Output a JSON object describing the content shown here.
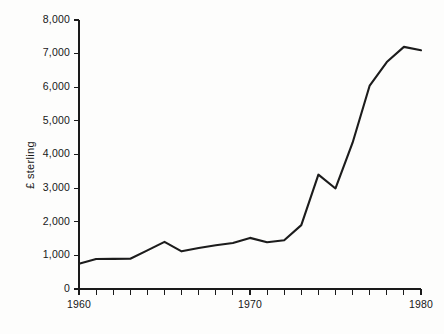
{
  "chart_data": {
    "type": "line",
    "title": "",
    "subtitle": "",
    "xlabel": "",
    "ylabel": "£ sterling",
    "xlim": [
      1960,
      1980
    ],
    "ylim": [
      0,
      8000
    ],
    "grid": false,
    "legend": false,
    "legend_position": "none",
    "x_tick_interval": 1,
    "x_labeled_ticks": [
      "1960",
      "1970",
      "1980"
    ],
    "y_tick_labels": [
      "0",
      "1,000",
      "2,000",
      "3,000",
      "4,000",
      "5,000",
      "6,000",
      "7,000",
      "8,000"
    ],
    "y_tick_values": [
      0,
      1000,
      2000,
      3000,
      4000,
      5000,
      6000,
      7000,
      8000
    ],
    "x": [
      1960,
      1961,
      1962,
      1963,
      1964,
      1965,
      1966,
      1967,
      1968,
      1969,
      1970,
      1971,
      1972,
      1973,
      1974,
      1975,
      1976,
      1977,
      1978,
      1979,
      1980
    ],
    "series": [
      {
        "name": "£ sterling",
        "color": "#1c1c1c",
        "values": [
          750,
          890,
          895,
          900,
          1150,
          1400,
          1120,
          1220,
          1300,
          1370,
          1520,
          1390,
          1450,
          1900,
          3400,
          2990,
          4350,
          6050,
          6750,
          7200,
          7100
        ]
      }
    ]
  },
  "axes": {
    "y_axis_title": "£ sterling",
    "y_ticks": [
      {
        "label": "8,000",
        "value": 8000
      },
      {
        "label": "7,000",
        "value": 7000
      },
      {
        "label": "6,000",
        "value": 6000
      },
      {
        "label": "5,000",
        "value": 5000
      },
      {
        "label": "4,000",
        "value": 4000
      },
      {
        "label": "3,000",
        "value": 3000
      },
      {
        "label": "2,000",
        "value": 2000
      },
      {
        "label": "1,000",
        "value": 1000
      },
      {
        "label": "0",
        "value": 0
      }
    ],
    "x_ticks": [
      {
        "label": "1960",
        "value": 1960
      },
      {
        "label": "",
        "value": 1961
      },
      {
        "label": "",
        "value": 1962
      },
      {
        "label": "",
        "value": 1963
      },
      {
        "label": "",
        "value": 1964
      },
      {
        "label": "",
        "value": 1965
      },
      {
        "label": "",
        "value": 1966
      },
      {
        "label": "",
        "value": 1967
      },
      {
        "label": "",
        "value": 1968
      },
      {
        "label": "",
        "value": 1969
      },
      {
        "label": "1970",
        "value": 1970
      },
      {
        "label": "",
        "value": 1971
      },
      {
        "label": "",
        "value": 1972
      },
      {
        "label": "",
        "value": 1973
      },
      {
        "label": "",
        "value": 1974
      },
      {
        "label": "",
        "value": 1975
      },
      {
        "label": "",
        "value": 1976
      },
      {
        "label": "",
        "value": 1977
      },
      {
        "label": "",
        "value": 1978
      },
      {
        "label": "",
        "value": 1979
      },
      {
        "label": "1980",
        "value": 1980
      }
    ]
  },
  "colors": {
    "background": "#fdfdfc",
    "axis": "#1a1a1a",
    "line": "#1c1c1c",
    "text": "#171717"
  }
}
